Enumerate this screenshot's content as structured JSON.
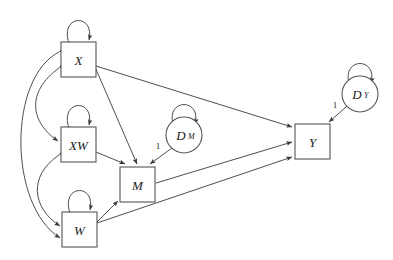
{
  "diagram": {
    "type": "path-diagram",
    "title": "",
    "background_color": "#ffffff",
    "node_stroke_color": "#555555",
    "edge_stroke_color": "#3a3a3a",
    "node_fill_color": "#ffffff",
    "nodes": [
      {
        "id": "X",
        "label": "X",
        "sub": "",
        "shape": "rect",
        "x": 61,
        "y": 42,
        "w": 35,
        "h": 35
      },
      {
        "id": "XW",
        "label": "XW",
        "sub": "",
        "shape": "rect",
        "x": 61,
        "y": 127,
        "w": 35,
        "h": 35
      },
      {
        "id": "W",
        "label": "W",
        "sub": "",
        "shape": "rect",
        "x": 62,
        "y": 212,
        "w": 35,
        "h": 35
      },
      {
        "id": "M",
        "label": "M",
        "sub": "",
        "shape": "rect",
        "x": 120,
        "y": 167,
        "w": 35,
        "h": 35
      },
      {
        "id": "Y",
        "label": "Y",
        "sub": "",
        "shape": "rect",
        "x": 295,
        "y": 124,
        "w": 35,
        "h": 35
      },
      {
        "id": "DM",
        "label": "D",
        "sub": "M",
        "shape": "circle",
        "cx": 184,
        "cy": 135,
        "r": 18
      },
      {
        "id": "DY",
        "label": "D",
        "sub": "Y",
        "shape": "circle",
        "cx": 360,
        "cy": 94,
        "r": 18
      }
    ],
    "directed_edges": [
      {
        "from": "X",
        "to": "M",
        "label": ""
      },
      {
        "from": "X",
        "to": "Y",
        "label": ""
      },
      {
        "from": "XW",
        "to": "M",
        "label": ""
      },
      {
        "from": "W",
        "to": "M",
        "label": ""
      },
      {
        "from": "W",
        "to": "Y",
        "label": ""
      },
      {
        "from": "M",
        "to": "Y",
        "label": ""
      },
      {
        "from": "DM",
        "to": "M",
        "label": "1"
      },
      {
        "from": "DY",
        "to": "Y",
        "label": "1"
      }
    ],
    "covariance_edges": [
      {
        "between": [
          "X",
          "XW"
        ],
        "label": ""
      },
      {
        "between": [
          "XW",
          "W"
        ],
        "label": ""
      },
      {
        "between": [
          "X",
          "W"
        ],
        "label": ""
      }
    ],
    "variance_loops": [
      {
        "on": "X",
        "label": ""
      },
      {
        "on": "XW",
        "label": ""
      },
      {
        "on": "W",
        "label": ""
      },
      {
        "on": "DM",
        "label": ""
      },
      {
        "on": "DY",
        "label": ""
      }
    ],
    "edge_labels": {
      "dm_to_m": "1",
      "dy_to_y": "1"
    }
  }
}
